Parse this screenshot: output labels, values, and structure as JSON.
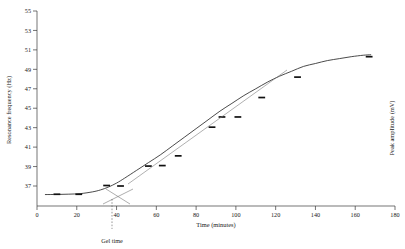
{
  "chart_data": {
    "type": "line",
    "title": "",
    "xlabel": "Time (minutes)",
    "ylabel": "Resonance frequency (Hz)",
    "y2label": "Peak amplitude (mV)",
    "xlim": [
      0,
      180
    ],
    "ylim": [
      36.1,
      55
    ],
    "xticks": [
      0,
      20,
      40,
      60,
      80,
      100,
      120,
      140,
      160,
      180
    ],
    "yticks": [
      37,
      39,
      41,
      43,
      45,
      47,
      49,
      51,
      53,
      55
    ],
    "grid": false,
    "legend": null,
    "series": [
      {
        "name": "Resonance frequency",
        "marker": "horizontal-dash",
        "x": [
          10,
          21,
          35,
          42,
          56,
          63,
          71,
          88,
          93,
          101,
          113,
          131,
          167
        ],
        "y": [
          36.15,
          36.15,
          37.05,
          37.0,
          39.05,
          39.1,
          40.1,
          43.05,
          44.1,
          44.1,
          46.1,
          48.2,
          50.3
        ]
      },
      {
        "name": "Sigmoid fit",
        "marker": "none",
        "x": [
          4,
          10,
          16,
          22,
          28,
          32,
          36,
          40,
          44,
          50,
          56,
          62,
          68,
          74,
          80,
          86,
          92,
          98,
          104,
          110,
          116,
          122,
          128,
          134,
          140,
          146,
          152,
          158,
          164,
          168
        ],
        "y": [
          36.12,
          36.13,
          36.16,
          36.22,
          36.4,
          36.6,
          36.9,
          37.3,
          37.8,
          38.6,
          39.4,
          40.2,
          41.1,
          42.0,
          42.9,
          43.8,
          44.7,
          45.5,
          46.3,
          47.0,
          47.7,
          48.3,
          48.8,
          49.3,
          49.6,
          49.9,
          50.1,
          50.3,
          50.45,
          50.5
        ]
      }
    ],
    "annotations": [
      {
        "name": "gel-time",
        "label": "Gel time",
        "x": 37.5,
        "style": "dashed-vertical-line"
      },
      {
        "name": "baseline-tangent-construction",
        "label": "",
        "style": "crossing-tangent-lines"
      },
      {
        "name": "inflection-tangent",
        "label": "",
        "style": "straight-line-overlay"
      }
    ]
  },
  "axes": {
    "x_label": "Time (minutes)",
    "y_label": "Resonance frequency (Hz)",
    "y2_label": "Peak amplitude (mV)",
    "x_ticks": [
      "0",
      "20",
      "40",
      "60",
      "80",
      "100",
      "120",
      "140",
      "160",
      "180"
    ],
    "y_ticks": [
      "37",
      "39",
      "41",
      "43",
      "45",
      "47",
      "49",
      "51",
      "53",
      "55"
    ]
  },
  "annotation": {
    "gel_time_label": "Gel time"
  },
  "colors": {
    "curve": "#2a2a2a",
    "marker": "#111111",
    "tangent": "#7a7a7a",
    "axis": "#3a3a3a",
    "background": "#ffffff"
  }
}
